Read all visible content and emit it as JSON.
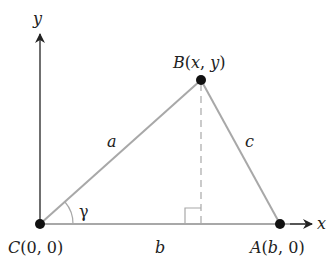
{
  "diagram": {
    "axes": {
      "x_label": "x",
      "y_label": "y"
    },
    "points": [
      {
        "id": "C",
        "label": "C(0, 0)",
        "name": "C",
        "coords": "0, 0"
      },
      {
        "id": "B",
        "label": "B(x, y)",
        "name": "B",
        "coords": "x, y"
      },
      {
        "id": "A",
        "label": "A(b, 0)",
        "name": "A",
        "coords": "b, 0"
      }
    ],
    "sides": {
      "a": "a",
      "b": "b",
      "c": "c"
    },
    "angle": "γ",
    "colors": {
      "side": "#a8a8a8",
      "axis": "#333333",
      "point": "#111111"
    }
  }
}
